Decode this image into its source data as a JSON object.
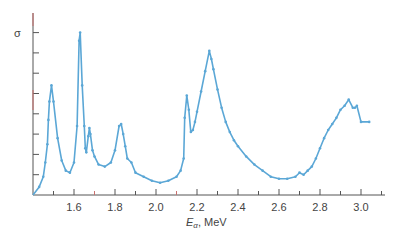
{
  "chart_data": {
    "type": "line",
    "title": "",
    "xlabel": "E_α, MeV",
    "xlabel_main": "E",
    "xlabel_sub": "α",
    "xlabel_unit": ", MeV",
    "ylabel": "σ",
    "xlim": [
      1.4,
      3.12
    ],
    "ylim": [
      0,
      8.5
    ],
    "x_ticks": [
      1.6,
      1.8,
      2.0,
      2.2,
      2.4,
      2.6,
      2.8,
      3.0
    ],
    "x_tick_labels": [
      "1.6",
      "1.8",
      "2.0",
      "2.2",
      "2.4",
      "2.6",
      "2.8",
      "3.0"
    ],
    "y_ticks": [
      1,
      2,
      3,
      4,
      5,
      6,
      7,
      8
    ],
    "grid": false,
    "legend": null,
    "series": [
      {
        "name": "cross section",
        "color": "#5ba7d6",
        "x": [
          1.4,
          1.43,
          1.45,
          1.46,
          1.47,
          1.475,
          1.48,
          1.49,
          1.5,
          1.52,
          1.54,
          1.56,
          1.58,
          1.6,
          1.615,
          1.625,
          1.63,
          1.64,
          1.65,
          1.655,
          1.66,
          1.67,
          1.675,
          1.68,
          1.69,
          1.7,
          1.72,
          1.75,
          1.78,
          1.8,
          1.82,
          1.83,
          1.84,
          1.85,
          1.86,
          1.88,
          1.9,
          1.94,
          1.98,
          2.02,
          2.06,
          2.1,
          2.12,
          2.135,
          2.14,
          2.15,
          2.16,
          2.17,
          2.18,
          2.19,
          2.2,
          2.22,
          2.24,
          2.26,
          2.27,
          2.28,
          2.3,
          2.32,
          2.34,
          2.36,
          2.38,
          2.4,
          2.44,
          2.48,
          2.52,
          2.56,
          2.6,
          2.64,
          2.68,
          2.7,
          2.72,
          2.74,
          2.76,
          2.78,
          2.8,
          2.82,
          2.84,
          2.86,
          2.88,
          2.9,
          2.92,
          2.94,
          2.96,
          2.97,
          2.98,
          3.0,
          3.04
        ],
        "y": [
          0.0,
          0.4,
          0.9,
          1.6,
          2.5,
          3.7,
          4.6,
          5.4,
          4.6,
          2.8,
          1.7,
          1.2,
          1.1,
          1.6,
          3.4,
          7.6,
          8.0,
          5.4,
          3.4,
          2.3,
          2.1,
          2.9,
          3.3,
          3.0,
          2.2,
          1.9,
          1.5,
          1.4,
          1.6,
          2.2,
          3.4,
          3.5,
          3.0,
          2.4,
          1.8,
          1.6,
          1.1,
          0.9,
          0.7,
          0.6,
          0.7,
          0.9,
          1.2,
          1.8,
          3.8,
          4.9,
          4.2,
          3.1,
          3.2,
          3.6,
          4.1,
          5.1,
          6.1,
          7.1,
          6.7,
          6.2,
          5.2,
          4.3,
          3.6,
          3.1,
          2.7,
          2.4,
          1.9,
          1.5,
          1.2,
          0.9,
          0.8,
          0.8,
          0.9,
          1.1,
          1.0,
          1.2,
          1.4,
          1.8,
          2.3,
          2.8,
          3.2,
          3.5,
          3.8,
          4.2,
          4.4,
          4.7,
          4.3,
          4.3,
          4.4,
          3.6,
          3.6
        ]
      }
    ]
  },
  "colors": {
    "curve": "#5ba7d6",
    "axis": "#555555",
    "tick_accent": "#c9706e",
    "label": "#444444"
  }
}
